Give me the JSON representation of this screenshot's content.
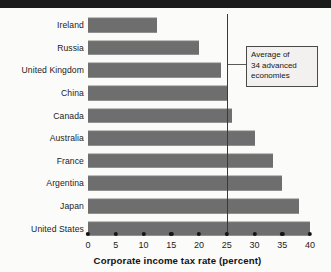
{
  "chart_data": {
    "type": "bar",
    "orientation": "horizontal",
    "title": "",
    "xlabel": "Corporate income tax rate (percent)",
    "ylabel": "",
    "xlim": [
      0,
      40
    ],
    "xticks": [
      0,
      5,
      10,
      15,
      20,
      25,
      30,
      35,
      40
    ],
    "xticklabels": [
      "0",
      "5",
      "10",
      "15",
      "20",
      "25",
      "30",
      "35",
      "40"
    ],
    "grid": false,
    "legend": null,
    "bar_color": "#6e6e6e",
    "categories": [
      "Ireland",
      "Russia",
      "United Kingdom",
      "China",
      "Canada",
      "Australia",
      "France",
      "Argentina",
      "Japan",
      "United States"
    ],
    "values": [
      12.5,
      20.0,
      24.0,
      25.0,
      26.0,
      30.0,
      33.3,
      35.0,
      38.0,
      40.0
    ],
    "annotations": [
      {
        "text_line_1": "Average of",
        "text_line_2": "34 advanced",
        "text_line_3": "economies",
        "reference_value": 25,
        "type": "vertical-reference-line"
      }
    ]
  },
  "axis": {
    "title": "Corporate income tax rate (percent)"
  },
  "annotation_box": {
    "line1": "Average of",
    "line2": "34 advanced",
    "line3": "economies"
  },
  "colors": {
    "bar": "#6e6e6e",
    "rule": "#1b1b1b",
    "reference_line": "#3a3a3a",
    "text": "#1c1c1c",
    "annotation_bg": "#f2f1ef"
  }
}
